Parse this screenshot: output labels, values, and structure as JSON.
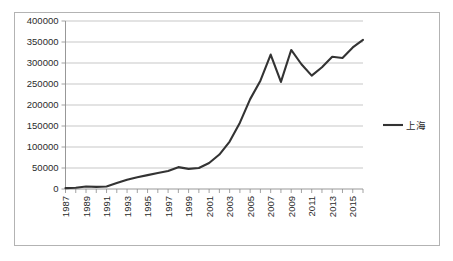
{
  "chart_data": {
    "type": "line",
    "title": "",
    "xlabel": "",
    "ylabel": "",
    "ylim": [
      0,
      400000
    ],
    "xlim": [
      1987,
      2016
    ],
    "grid": true,
    "legend_position": "right",
    "y_ticks": [
      0,
      50000,
      100000,
      150000,
      200000,
      250000,
      300000,
      350000,
      400000
    ],
    "y_tick_labels": [
      "0",
      "50000",
      "100000",
      "150000",
      "200000",
      "250000",
      "300000",
      "350000",
      "400000"
    ],
    "x_ticks": [
      1987,
      1988,
      1989,
      1990,
      1991,
      1992,
      1993,
      1994,
      1995,
      1996,
      1997,
      1998,
      1999,
      2000,
      2001,
      2002,
      2003,
      2004,
      2005,
      2006,
      2007,
      2008,
      2009,
      2010,
      2011,
      2012,
      2013,
      2014,
      2015,
      2016
    ],
    "x_tick_labels": [
      "1987",
      "1989",
      "1991",
      "1993",
      "1995",
      "1997",
      "1999",
      "2001",
      "2003",
      "2005",
      "2007",
      "2009",
      "2011",
      "2013",
      "2015"
    ],
    "x": [
      1987,
      1988,
      1989,
      1990,
      1991,
      1992,
      1993,
      1994,
      1995,
      1996,
      1997,
      1998,
      1999,
      2000,
      2001,
      2002,
      2003,
      2004,
      2005,
      2006,
      2007,
      2008,
      2009,
      2010,
      2011,
      2012,
      2013,
      2014,
      2015,
      2016
    ],
    "series": [
      {
        "name": "上海",
        "color": "#333333",
        "values": [
          2000,
          3000,
          6000,
          5000,
          6000,
          14000,
          22000,
          28000,
          33000,
          38000,
          43000,
          52000,
          48000,
          50000,
          62000,
          82000,
          113000,
          158000,
          214000,
          258000,
          320000,
          255000,
          331000,
          297000,
          270000,
          290000,
          315000,
          312000,
          337000,
          355000
        ]
      }
    ],
    "legend_entries": [
      {
        "label": "上海",
        "color": "#333333"
      }
    ]
  },
  "colors": {
    "frame_border": "#b3b3b3",
    "gridline": "#b0b0b0",
    "axis": "#8c8c8c",
    "series": "#333333",
    "text": "#2b2b2b",
    "background": "#ffffff"
  }
}
